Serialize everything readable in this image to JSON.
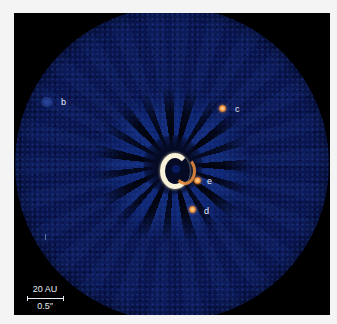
{
  "image": {
    "description": "Direct image of a central star with four orbiting planets",
    "background_color": "#000000",
    "disk_color": "#0c1a55",
    "star_color": "#f6f1d8",
    "planet_color": "#f0903a"
  },
  "planets": [
    {
      "label": "b",
      "x": 47,
      "y": 101
    },
    {
      "label": "c",
      "x": 222,
      "y": 108
    },
    {
      "label": "e",
      "x": 197,
      "y": 180
    },
    {
      "label": "d",
      "x": 192,
      "y": 210
    }
  ],
  "scale_bar": {
    "distance_label": "20 AU",
    "angle_label": "0.5″"
  }
}
